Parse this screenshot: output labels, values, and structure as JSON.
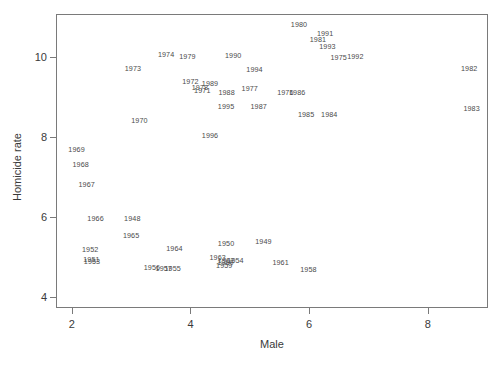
{
  "chart_data": {
    "type": "scatter",
    "title": "",
    "xlabel": "Male",
    "ylabel": "Homicide rate",
    "xlim": [
      1.75,
      9.0
    ],
    "ylim": [
      3.75,
      11.05
    ],
    "xticks": [
      2,
      4,
      6,
      8
    ],
    "yticks": [
      4,
      6,
      8,
      10
    ],
    "xticklabels": [
      "2",
      "4",
      "6",
      "8"
    ],
    "yticklabels": [
      "4",
      "6",
      "8",
      "10"
    ],
    "grid": false,
    "legend": null,
    "marker": "text-label",
    "point_label_field": "label",
    "points": [
      {
        "label": "1948",
        "x": 3.02,
        "y": 5.95
      },
      {
        "label": "1949",
        "x": 5.23,
        "y": 5.37
      },
      {
        "label": "1950",
        "x": 4.6,
        "y": 5.33
      },
      {
        "label": "1951",
        "x": 2.33,
        "y": 4.93
      },
      {
        "label": "1952",
        "x": 2.31,
        "y": 5.17
      },
      {
        "label": "1953",
        "x": 2.34,
        "y": 4.87
      },
      {
        "label": "1954",
        "x": 4.76,
        "y": 4.9
      },
      {
        "label": "1955",
        "x": 3.7,
        "y": 4.7
      },
      {
        "label": "1956",
        "x": 3.35,
        "y": 4.73
      },
      {
        "label": "1957",
        "x": 3.55,
        "y": 4.69
      },
      {
        "label": "1958",
        "x": 5.99,
        "y": 4.67
      },
      {
        "label": "1959",
        "x": 4.57,
        "y": 4.78
      },
      {
        "label": "1960",
        "x": 4.59,
        "y": 4.84
      },
      {
        "label": "1961",
        "x": 5.52,
        "y": 4.85
      },
      {
        "label": "1962",
        "x": 4.6,
        "y": 4.9
      },
      {
        "label": "1963",
        "x": 4.46,
        "y": 4.97
      },
      {
        "label": "1964",
        "x": 3.73,
        "y": 5.2
      },
      {
        "label": "1965",
        "x": 3.0,
        "y": 5.53
      },
      {
        "label": "1966",
        "x": 2.4,
        "y": 5.95
      },
      {
        "label": "1967",
        "x": 2.25,
        "y": 6.81
      },
      {
        "label": "1968",
        "x": 2.15,
        "y": 7.3
      },
      {
        "label": "1969",
        "x": 2.08,
        "y": 7.68
      },
      {
        "label": "1970",
        "x": 3.14,
        "y": 8.41
      },
      {
        "label": "1971",
        "x": 4.2,
        "y": 9.14
      },
      {
        "label": "1972",
        "x": 4.0,
        "y": 9.38
      },
      {
        "label": "1973",
        "x": 3.03,
        "y": 9.71
      },
      {
        "label": "1974",
        "x": 3.59,
        "y": 10.06
      },
      {
        "label": "1975",
        "x": 6.5,
        "y": 9.98
      },
      {
        "label": "1977",
        "x": 5.0,
        "y": 9.2
      },
      {
        "label": "1978",
        "x": 4.16,
        "y": 9.23
      },
      {
        "label": "1979",
        "x": 3.95,
        "y": 10.01
      },
      {
        "label": "1980",
        "x": 5.83,
        "y": 10.79
      },
      {
        "label": "1981",
        "x": 6.15,
        "y": 10.42
      },
      {
        "label": "1982",
        "x": 8.7,
        "y": 9.71
      },
      {
        "label": "1983",
        "x": 8.74,
        "y": 8.7
      },
      {
        "label": "1984",
        "x": 6.34,
        "y": 8.56
      },
      {
        "label": "1985",
        "x": 5.95,
        "y": 8.56
      },
      {
        "label": "1986",
        "x": 5.8,
        "y": 9.11
      },
      {
        "label": "1987",
        "x": 5.15,
        "y": 8.75
      },
      {
        "label": "1988",
        "x": 4.61,
        "y": 9.1
      },
      {
        "label": "1989",
        "x": 4.33,
        "y": 9.32
      },
      {
        "label": "1990",
        "x": 4.72,
        "y": 10.03
      },
      {
        "label": "1991",
        "x": 6.27,
        "y": 10.57
      },
      {
        "label": "1992",
        "x": 6.78,
        "y": 10.01
      },
      {
        "label": "1993",
        "x": 6.31,
        "y": 10.24
      },
      {
        "label": "1994",
        "x": 5.08,
        "y": 9.67
      },
      {
        "label": "1995",
        "x": 4.6,
        "y": 8.75
      },
      {
        "label": "1996",
        "x": 4.33,
        "y": 8.02
      },
      {
        "label": "1976",
        "x": 5.6,
        "y": 9.11
      }
    ]
  },
  "style": {
    "frame_color": "#7a7a7a",
    "text_color": "#3a3a3a",
    "point_color": "#4a4a4a",
    "background": "#ffffff"
  }
}
